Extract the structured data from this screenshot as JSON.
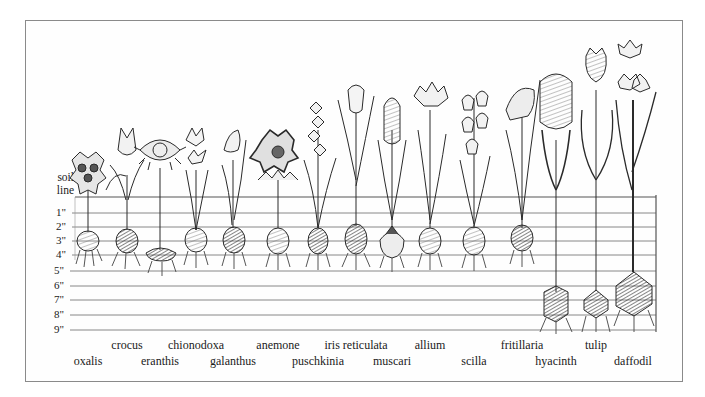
{
  "diagram": {
    "title": "",
    "soil_caption": [
      "soil",
      "line"
    ],
    "depth_labels": [
      "1\"",
      "2\"",
      "3\"",
      "4\"",
      "5\"",
      "6\"",
      "7\"",
      "8\"",
      "9\""
    ],
    "colors": {
      "ink": "#2a2a2a",
      "grid": "#7a7a7a",
      "frame": "#8a8a8a",
      "background": "#ffffff"
    },
    "plants": [
      {
        "name": "oxalis",
        "row": "bottom",
        "x": 88,
        "bulb_depth_in": 3
      },
      {
        "name": "crocus",
        "row": "top",
        "x": 127,
        "bulb_depth_in": 3
      },
      {
        "name": "eranthis",
        "row": "bottom",
        "x": 160,
        "bulb_depth_in": 4
      },
      {
        "name": "chionodoxa",
        "row": "top",
        "x": 196,
        "bulb_depth_in": 3
      },
      {
        "name": "galanthus",
        "row": "bottom",
        "x": 233,
        "bulb_depth_in": 3
      },
      {
        "name": "anemone",
        "row": "top",
        "x": 278,
        "bulb_depth_in": 3
      },
      {
        "name": "puschkinia",
        "row": "bottom",
        "x": 318,
        "bulb_depth_in": 3
      },
      {
        "name": "iris reticulata",
        "row": "top",
        "x": 356,
        "bulb_depth_in": 3
      },
      {
        "name": "muscari",
        "row": "bottom",
        "x": 392,
        "bulb_depth_in": 3.5
      },
      {
        "name": "allium",
        "row": "top",
        "x": 430,
        "bulb_depth_in": 3
      },
      {
        "name": "scilla",
        "row": "bottom",
        "x": 474,
        "bulb_depth_in": 3
      },
      {
        "name": "fritillaria",
        "row": "top",
        "x": 522,
        "bulb_depth_in": 3
      },
      {
        "name": "hyacinth",
        "row": "bottom",
        "x": 556,
        "bulb_depth_in": 8
      },
      {
        "name": "tulip",
        "row": "top",
        "x": 596,
        "bulb_depth_in": 8
      },
      {
        "name": "daffodil",
        "row": "bottom",
        "x": 633,
        "bulb_depth_in": 7.5
      }
    ]
  }
}
